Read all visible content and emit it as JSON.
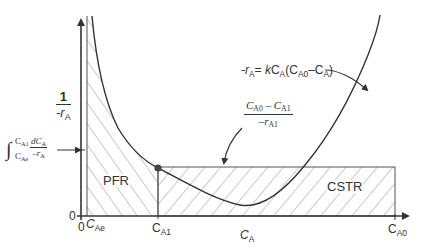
{
  "diagram": {
    "y_axis": {
      "label_num": "1",
      "label_den_prefix": "-r",
      "label_den_sub": "A",
      "origin_label": "0"
    },
    "x_axis": {
      "label_main": "C",
      "label_sub": "A",
      "origin_label": "0",
      "ticks": [
        {
          "main": "C",
          "sub": "Ae"
        },
        {
          "main": "C",
          "sub": "A1"
        },
        {
          "main": "C",
          "sub": "A0"
        }
      ]
    },
    "regions": {
      "pfr_label": "PFR",
      "cstr_label": "CSTR"
    },
    "annotations": {
      "rate_law": {
        "prefix": "-r",
        "prefix_sub": "A",
        "eq": "= ",
        "k": "k",
        "c1": "C",
        "c1_sub": "A",
        "paren_open": "(C",
        "c2_sub": "A0",
        "minus": "–C",
        "c3_sub": "A",
        "paren_close": ")"
      },
      "cstr_area": {
        "num_a": "C",
        "num_a_sub": "A0",
        "num_minus": " – C",
        "num_b_sub": "A1",
        "den": "–r",
        "den_sub": "A1"
      },
      "pfr_integral": {
        "symbol": "∫",
        "upper": "C",
        "upper_sub": "A1",
        "lower": "C",
        "lower_sub": "Ae",
        "num": "dC",
        "num_sub": "A",
        "den": "–r",
        "den_sub": "A"
      }
    },
    "colors": {
      "line": "#3a3a3a",
      "hatch": "#8a8a8a",
      "point": "#444444"
    }
  }
}
